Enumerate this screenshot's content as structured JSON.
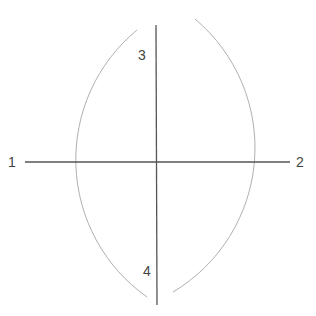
{
  "diagram": {
    "type": "perpendicular-bisector-construction",
    "labels": {
      "p1": "1",
      "p2": "2",
      "p3": "3",
      "p4": "4"
    },
    "points": {
      "p1": [
        25,
        162
      ],
      "p2": [
        290,
        162
      ],
      "p3": [
        156,
        57
      ],
      "p4": [
        156,
        270
      ]
    },
    "arc_radius": 168,
    "colors": {
      "main_line": "#555555",
      "arc": "#aaaaaa",
      "label": "#444444"
    }
  }
}
